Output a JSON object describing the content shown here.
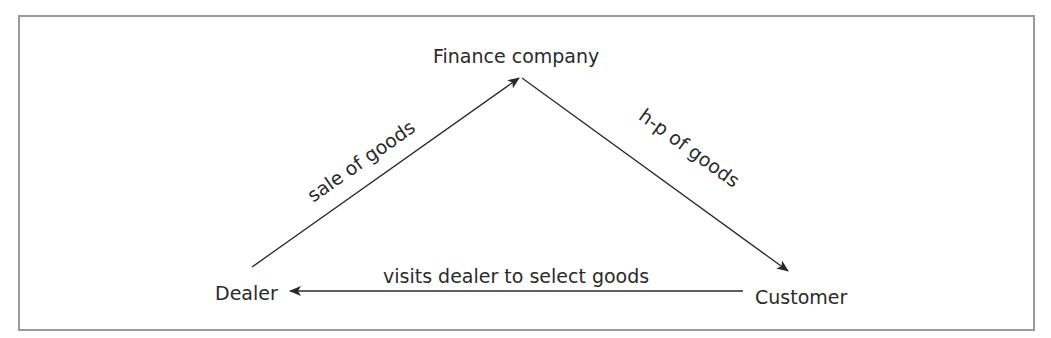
{
  "diagram": {
    "nodes": {
      "finance": {
        "label": "Finance company"
      },
      "dealer": {
        "label": "Dealer"
      },
      "customer": {
        "label": "Customer"
      }
    },
    "edges": [
      {
        "from": "dealer",
        "to": "finance",
        "label": "sale of goods"
      },
      {
        "from": "finance",
        "to": "customer",
        "label": "h-p of goods"
      },
      {
        "from": "customer",
        "to": "dealer",
        "label": "visits dealer to select goods"
      }
    ],
    "colors": {
      "line": "#2a2a2a",
      "frame": "#9a9a9a",
      "text": "#2a2a2a"
    }
  }
}
